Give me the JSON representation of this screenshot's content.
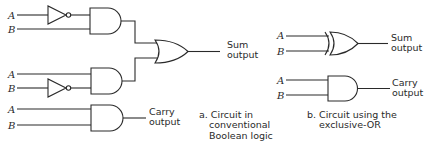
{
  "diagram": {
    "panel_a": {
      "caption_lines": [
        "a. Circuit in",
        "conventional",
        "Boolean logic"
      ],
      "inputs": {
        "row1": {
          "a": "A",
          "b": "B"
        },
        "row2": {
          "a": "A",
          "b": "B"
        },
        "row3": {
          "a": "A",
          "b": "B"
        }
      },
      "outputs": {
        "sum": [
          "Sum",
          "output"
        ],
        "carry": [
          "Carry",
          "output"
        ]
      },
      "gates": [
        {
          "type": "NOT",
          "input": "A",
          "row": 1
        },
        {
          "type": "AND",
          "inputs": [
            "NOT A",
            "B"
          ],
          "row": 1
        },
        {
          "type": "NOT",
          "input": "B",
          "row": 2
        },
        {
          "type": "AND",
          "inputs": [
            "A",
            "NOT B"
          ],
          "row": 2
        },
        {
          "type": "OR",
          "inputs": [
            "AND1",
            "AND2"
          ],
          "output": "Sum output"
        },
        {
          "type": "AND",
          "inputs": [
            "A",
            "B"
          ],
          "row": 3,
          "output": "Carry output"
        }
      ]
    },
    "panel_b": {
      "caption_lines": [
        "b. Circuit using the",
        "exclusive-OR"
      ],
      "inputs": {
        "xor": {
          "a": "A",
          "b": "B"
        },
        "and": {
          "a": "A",
          "b": "B"
        }
      },
      "outputs": {
        "sum": [
          "Sum",
          "output"
        ],
        "carry": [
          "Carry",
          "output"
        ]
      },
      "gates": [
        {
          "type": "XOR",
          "inputs": [
            "A",
            "B"
          ],
          "output": "Sum output"
        },
        {
          "type": "AND",
          "inputs": [
            "A",
            "B"
          ],
          "output": "Carry output"
        }
      ]
    }
  }
}
